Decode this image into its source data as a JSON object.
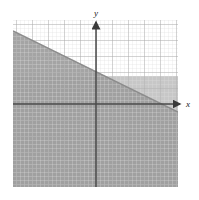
{
  "figure": {
    "kind": "coordinate-plane-inequality-graph",
    "background_color": "#ffffff",
    "axis_labels": {
      "x": "x",
      "y": "y"
    },
    "axis_color": "#4a4a4a",
    "grid": {
      "minor_color": "#d8d8d8",
      "major_color": "#a9a9a9",
      "minor_step_px": 4,
      "major_step_px": 16,
      "left_px": 13,
      "top_px": 20,
      "right_px": 178,
      "bottom_px": 187
    },
    "origin_px": {
      "x": 96,
      "y": 104
    },
    "shading": {
      "primary_fill": "#9a9a9a",
      "secondary_fill": "#c2c2c2",
      "band_boundary_y_px": 76,
      "description": "half-plane below the line is shaded"
    },
    "boundary_line": {
      "color": "#8a8a8a",
      "start_px": {
        "x": 13,
        "y": 31
      },
      "end_px": {
        "x": 178,
        "y": 112
      },
      "slope": -0.49,
      "style": "solid"
    },
    "arrows": {
      "y_axis_tip_px": {
        "x": 96,
        "y": 20
      },
      "x_axis_tip_px": {
        "x": 182,
        "y": 104
      }
    }
  },
  "artifact": {
    "top_mark": ""
  }
}
